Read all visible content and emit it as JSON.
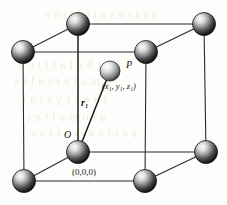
{
  "figure": {
    "kind": "crystal-unit-cell-diagram",
    "width": 227,
    "height": 205
  },
  "colors": {
    "background": "#fdfdfb",
    "edge": "#2b2b2b",
    "vector": "#1a1a1a",
    "sphere_dark": "#1c1c1c",
    "sphere_mid": "#8d8d8d",
    "sphere_light": "#f2f2f2",
    "sphere_outline": "#111111",
    "interior_sphere_mid": "#b6b6b6",
    "label_text": "#1a1a1a",
    "show_through_text": "#cfc29a"
  },
  "labels": {
    "point_p": "P",
    "point_p_coords": "(x₁, y₁, z₁)",
    "vector_r": "r₁",
    "origin": "O",
    "origin_coords": "(0,0,0)"
  },
  "geometry": {
    "front_face": {
      "top_left": [
        23,
        52
      ],
      "top_right": [
        146,
        52
      ],
      "bottom_left": [
        24,
        181
      ],
      "bottom_right": [
        145,
        181
      ]
    },
    "back_face": {
      "top_left": [
        78,
        24
      ],
      "top_right": [
        204,
        24
      ],
      "bottom_left": [
        78,
        152
      ],
      "bottom_right": [
        206,
        152
      ]
    },
    "origin_corner": [
      78,
      152
    ],
    "point_p": [
      110,
      71
    ],
    "sphere_radius": 11.5,
    "interior_sphere_radius": 10.0
  },
  "atoms": [
    {
      "name": "corner-front-top-left",
      "cx": 23,
      "cy": 52,
      "r": 11.5
    },
    {
      "name": "corner-front-top-right",
      "cx": 146,
      "cy": 52,
      "r": 11.5
    },
    {
      "name": "corner-back-top-left",
      "cx": 78,
      "cy": 24,
      "r": 11.5
    },
    {
      "name": "corner-back-top-right",
      "cx": 204,
      "cy": 24,
      "r": 11.5
    },
    {
      "name": "corner-front-bottom-left",
      "cx": 24,
      "cy": 181,
      "r": 11.5
    },
    {
      "name": "corner-front-bottom-right",
      "cx": 145,
      "cy": 181,
      "r": 11.5
    },
    {
      "name": "corner-back-bottom-right",
      "cx": 206,
      "cy": 152,
      "r": 11.5
    },
    {
      "name": "corner-origin",
      "cx": 78,
      "cy": 152,
      "r": 11.5
    }
  ],
  "edges": [
    {
      "name": "edge-front-top",
      "x1": 23,
      "y1": 52,
      "x2": 146,
      "y2": 52
    },
    {
      "name": "edge-front-left",
      "x1": 23,
      "y1": 52,
      "x2": 24,
      "y2": 181
    },
    {
      "name": "edge-front-bottom",
      "x1": 24,
      "y1": 181,
      "x2": 145,
      "y2": 181
    },
    {
      "name": "edge-front-right",
      "x1": 146,
      "y1": 52,
      "x2": 145,
      "y2": 181
    },
    {
      "name": "edge-back-top",
      "x1": 78,
      "y1": 24,
      "x2": 204,
      "y2": 24
    },
    {
      "name": "edge-back-left",
      "x1": 78,
      "y1": 24,
      "x2": 78,
      "y2": 152
    },
    {
      "name": "edge-back-bottom",
      "x1": 78,
      "y1": 152,
      "x2": 206,
      "y2": 152
    },
    {
      "name": "edge-back-right",
      "x1": 204,
      "y1": 24,
      "x2": 206,
      "y2": 152
    },
    {
      "name": "edge-depth-top-left",
      "x1": 23,
      "y1": 52,
      "x2": 78,
      "y2": 24
    },
    {
      "name": "edge-depth-top-right",
      "x1": 146,
      "y1": 52,
      "x2": 204,
      "y2": 24
    },
    {
      "name": "edge-depth-bottom-left",
      "x1": 24,
      "y1": 181,
      "x2": 78,
      "y2": 152
    },
    {
      "name": "edge-depth-bottom-right",
      "x1": 145,
      "y1": 181,
      "x2": 206,
      "y2": 152
    },
    {
      "name": "edge-depth-mid-left",
      "x1": 78,
      "y1": 152,
      "x2": 78,
      "y2": 24
    }
  ],
  "vector": {
    "name": "position-vector-r1",
    "from": [
      78,
      152
    ],
    "to": [
      110,
      71
    ]
  },
  "show_through": {
    "lines": [
      {
        "text": "a s a  r e s u l t  o f  t h e",
        "x": 44,
        "y": 14,
        "size": 11
      },
      {
        "text": "o n  t h e  l a t t i c e",
        "x": 18,
        "y": 64,
        "size": 12
      },
      {
        "text": "e  m a t e r i a l  i s",
        "x": 14,
        "y": 80,
        "size": 12
      },
      {
        "text": "t h e  c r y s t a l",
        "x": 22,
        "y": 98,
        "size": 12
      },
      {
        "text": "a t o m  s i t e s",
        "x": 26,
        "y": 116,
        "size": 12
      },
      {
        "text": "p e r i o d i c  a r r a y",
        "x": 30,
        "y": 130,
        "size": 11
      }
    ]
  }
}
